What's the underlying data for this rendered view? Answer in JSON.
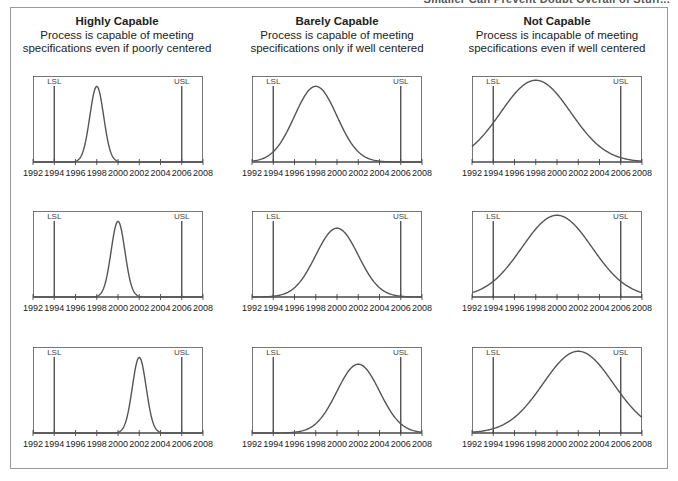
{
  "caption_clipped": "Smaller Can Prevent Doubt Overall of Stuff...",
  "columns": [
    {
      "title": "Highly Capable",
      "line1": "Process is capable of meeting",
      "line2": "specifications even if poorly centered"
    },
    {
      "title": "Barely Capable",
      "line1": "Process is capable of meeting",
      "line2": "specifications only if well centered"
    },
    {
      "title": "Not Capable",
      "line1": "Process is incapable of meeting",
      "line2": "specifications even if well centered"
    }
  ],
  "chart_data": {
    "type": "line",
    "xlabel": "",
    "ylabel": "",
    "xlim": [
      1992,
      2008
    ],
    "x_ticks": [
      1992,
      1994,
      1996,
      1998,
      2000,
      2002,
      2004,
      2006,
      2008
    ],
    "spec_limits": {
      "LSL": 1994,
      "USL": 2006
    },
    "grid": false,
    "panels": [
      {
        "row": 0,
        "col": 0,
        "column": "Highly Capable",
        "mean": 1998,
        "sigma": 0.65,
        "peak_fraction": 0.88
      },
      {
        "row": 0,
        "col": 1,
        "column": "Barely Capable",
        "mean": 1998,
        "sigma": 2.0,
        "peak_fraction": 0.88
      },
      {
        "row": 0,
        "col": 2,
        "column": "Not Capable",
        "mean": 1998,
        "sigma": 3.3,
        "peak_fraction": 0.95
      },
      {
        "row": 1,
        "col": 0,
        "column": "Highly Capable",
        "mean": 2000,
        "sigma": 0.65,
        "peak_fraction": 0.88
      },
      {
        "row": 1,
        "col": 1,
        "column": "Barely Capable",
        "mean": 2000,
        "sigma": 2.0,
        "peak_fraction": 0.8
      },
      {
        "row": 1,
        "col": 2,
        "column": "Not Capable",
        "mean": 2000,
        "sigma": 3.3,
        "peak_fraction": 0.95
      },
      {
        "row": 2,
        "col": 0,
        "column": "Highly Capable",
        "mean": 2002,
        "sigma": 0.65,
        "peak_fraction": 0.88
      },
      {
        "row": 2,
        "col": 1,
        "column": "Barely Capable",
        "mean": 2002,
        "sigma": 2.0,
        "peak_fraction": 0.8
      },
      {
        "row": 2,
        "col": 2,
        "column": "Not Capable",
        "mean": 2002,
        "sigma": 3.3,
        "peak_fraction": 0.95
      }
    ]
  },
  "style": {
    "curve_color": "#555555",
    "axis_color": "#333333",
    "limit_color": "#444444",
    "frame_color": "#9a9a9a"
  }
}
